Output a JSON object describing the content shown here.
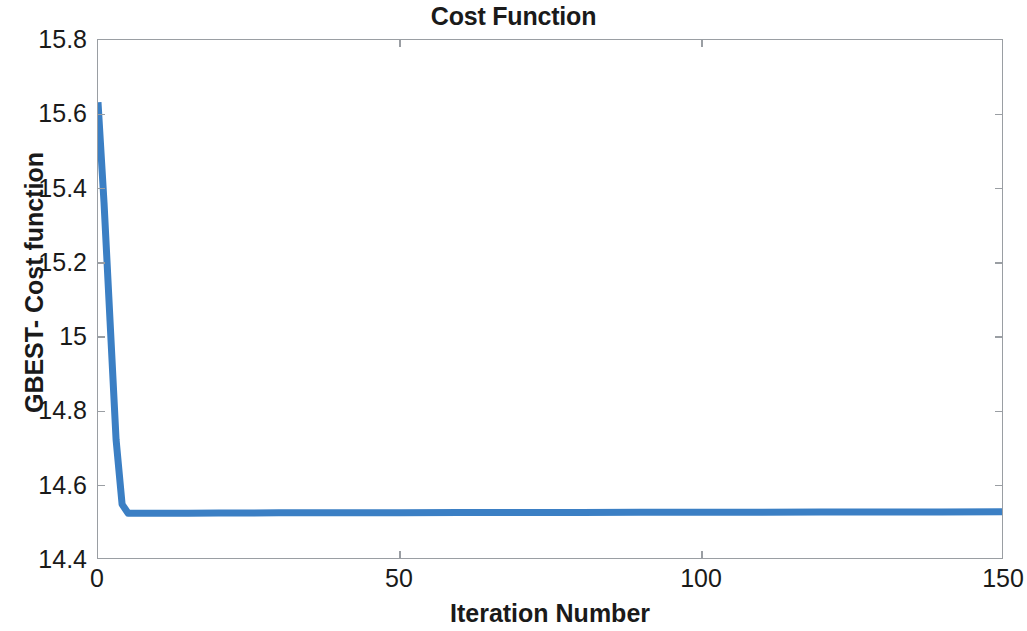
{
  "chart_data": {
    "type": "line",
    "title": "Cost Function",
    "xlabel": "Iteration Number",
    "ylabel": "GBEST- Cost function",
    "xlim": [
      0,
      150
    ],
    "ylim": [
      14.4,
      15.8
    ],
    "grid": false,
    "legend": null,
    "line_color": "#3b7fc4",
    "line_width": 7,
    "axis_color": "#9a9ea3",
    "background": "#ffffff",
    "xticks": [
      0,
      50,
      100,
      150
    ],
    "xticklabels": [
      "0",
      "50",
      "100",
      "150"
    ],
    "yticks": [
      14.4,
      14.6,
      14.8,
      15,
      15.2,
      15.4,
      15.6,
      15.8
    ],
    "yticklabels": [
      "14.4",
      "14.6",
      "14.8",
      "15",
      "15.2",
      "15.4",
      "15.6",
      "15.8"
    ],
    "series": [
      {
        "name": "GBEST- Cost function",
        "x": [
          0,
          1,
          2,
          3,
          4,
          5,
          6,
          8,
          10,
          15,
          20,
          30,
          40,
          50,
          60,
          70,
          80,
          90,
          100,
          110,
          120,
          130,
          140,
          150
        ],
        "y": [
          15.632,
          15.36,
          15.04,
          14.72,
          14.545,
          14.521,
          14.521,
          14.521,
          14.521,
          14.521,
          14.5215,
          14.522,
          14.5222,
          14.5225,
          14.5228,
          14.523,
          14.5232,
          14.5234,
          14.5236,
          14.5238,
          14.524,
          14.5243,
          14.5246,
          14.525
        ]
      }
    ]
  }
}
